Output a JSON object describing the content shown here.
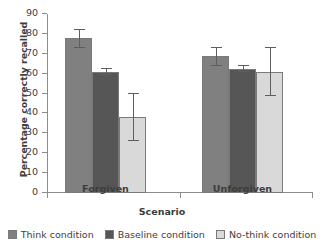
{
  "chart_data": {
    "type": "bar",
    "title": "",
    "xlabel": "Scenario",
    "ylabel": "Percentage correctly recalled",
    "categories": [
      "Forgiven",
      "Unforgiven"
    ],
    "ylim": [
      0,
      90
    ],
    "yticks": [
      0,
      10,
      20,
      30,
      40,
      50,
      60,
      70,
      80,
      90
    ],
    "grid": false,
    "legend_position": "bottom",
    "series": [
      {
        "name": "Think condition",
        "color": "#808080",
        "values": [
          78,
          69
        ],
        "errors_low": [
          73,
          64
        ],
        "errors_high": [
          82,
          73
        ]
      },
      {
        "name": "Baseline condition",
        "color": "#565656",
        "values": [
          61,
          62.5
        ],
        "errors_low": [
          59.5,
          61
        ],
        "errors_high": [
          62.5,
          64
        ]
      },
      {
        "name": "No-think condition",
        "color": "#d9d9d9",
        "values": [
          38,
          61
        ],
        "errors_low": [
          26,
          49
        ],
        "errors_high": [
          50,
          73
        ]
      }
    ]
  }
}
